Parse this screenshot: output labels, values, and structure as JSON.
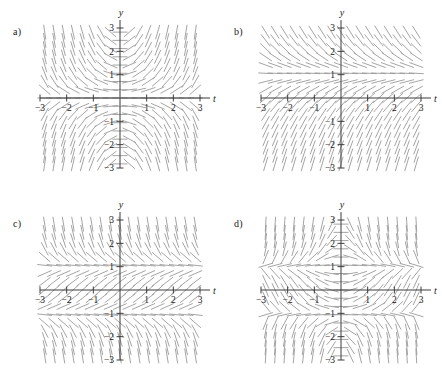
{
  "figure": {
    "type": "slope-field-grid",
    "rows": 2,
    "cols": 2,
    "background": "#ffffff",
    "field_color": "#9a9a9a",
    "axis_color": "#3c3c3c",
    "label_color": "#1a1a1a"
  },
  "panels": [
    {
      "id": "a",
      "label": "a)",
      "axis": {
        "xlabel": "t",
        "ylabel": "y",
        "xlim": [
          -3,
          3
        ],
        "ylim": [
          -3,
          3
        ],
        "xticks": [
          -3,
          -2,
          -1,
          1,
          2,
          3
        ],
        "yticks": [
          -3,
          -2,
          -1,
          1,
          2,
          3
        ],
        "xtick_labels": [
          "−3",
          "−2",
          "−1",
          "1",
          "2",
          "3"
        ],
        "ytick_labels": [
          "−3",
          "−2",
          "−1",
          "1",
          "2",
          "3"
        ],
        "grid": false
      },
      "chart_data": {
        "type": "scatter",
        "description": "Direction field: short line segments of slope dy/dt on a uniform grid over t in [-3,3], y in [-3,3]. Segments are near-vertical for t<0 and flatten into nested horizontal curves opening to the right for t>0.",
        "slope_formula": "ty",
        "grid_step": 0.3529,
        "segment_length": 0.28
      }
    },
    {
      "id": "b",
      "label": "b)",
      "axis": {
        "xlabel": "t",
        "ylabel": "y",
        "xlim": [
          -3,
          3
        ],
        "ylim": [
          -3,
          3
        ],
        "xticks": [
          -3,
          -2,
          -1,
          1,
          2,
          3
        ],
        "yticks": [
          -3,
          -2,
          -1,
          1,
          2,
          3
        ],
        "xtick_labels": [
          "−3",
          "−2",
          "−1",
          "1",
          "2",
          "3"
        ],
        "ytick_labels": [
          "−3",
          "−2",
          "−1",
          "1",
          "2",
          "3"
        ],
        "grid": false
      },
      "chart_data": {
        "type": "scatter",
        "description": "Autonomous direction field depending only on y. Horizontal (zero-slope) nullcline row at y = 1; slopes tilt upward-right below y = 1 and downward-right above y = 1, steepening away from the nullcline.",
        "slope_formula": "1 - y",
        "nullclines": [
          1
        ],
        "grid_step": 0.3529,
        "segment_length": 0.28
      }
    },
    {
      "id": "c",
      "label": "c)",
      "axis": {
        "xlabel": "t",
        "ylabel": "y",
        "xlim": [
          -3,
          3
        ],
        "ylim": [
          -3,
          3
        ],
        "xticks": [
          -3,
          -2,
          -1,
          1,
          2,
          3
        ],
        "yticks": [
          -3,
          -2,
          -1,
          1,
          2,
          3
        ],
        "xtick_labels": [
          "−3",
          "−2",
          "−1",
          "1",
          "2",
          "3"
        ],
        "ytick_labels": [
          "−3",
          "−2",
          "−1",
          "1",
          "2",
          "3"
        ],
        "grid": false
      },
      "chart_data": {
        "type": "scatter",
        "description": "Autonomous direction field depending only on y with two horizontal nullcline rows at y = 1 and y = -1; slopes are gentle between the nullclines and steepen toward the top and bottom of the window.",
        "slope_formula": "1 - y^2",
        "nullclines": [
          1,
          -1
        ],
        "grid_step": 0.3529,
        "segment_length": 0.28
      }
    },
    {
      "id": "d",
      "label": "d)",
      "axis": {
        "xlabel": "t",
        "ylabel": "y",
        "xlim": [
          -3,
          3
        ],
        "ylim": [
          -3,
          3
        ],
        "xticks": [
          -3,
          -2,
          -1,
          1,
          2,
          3
        ],
        "yticks": [
          -3,
          -2,
          -1,
          1,
          2,
          3
        ],
        "xtick_labels": [
          "−3",
          "−2",
          "−1",
          "1",
          "2",
          "3"
        ],
        "ytick_labels": [
          "−3",
          "−2",
          "−1",
          "1",
          "2",
          "3"
        ],
        "grid": false
      },
      "chart_data": {
        "type": "scatter",
        "description": "Non-autonomous direction field depending on both t and y. Horizontal nullcline structure near y = 1 and y = -1 is broken by t-dependence, producing swirling saddle-like patterns near t = -1 and t = 1 and near-vertical segments at the far left and right edges.",
        "slope_formula": "(1 - y^2) * t",
        "grid_step": 0.3529,
        "segment_length": 0.28
      }
    }
  ]
}
